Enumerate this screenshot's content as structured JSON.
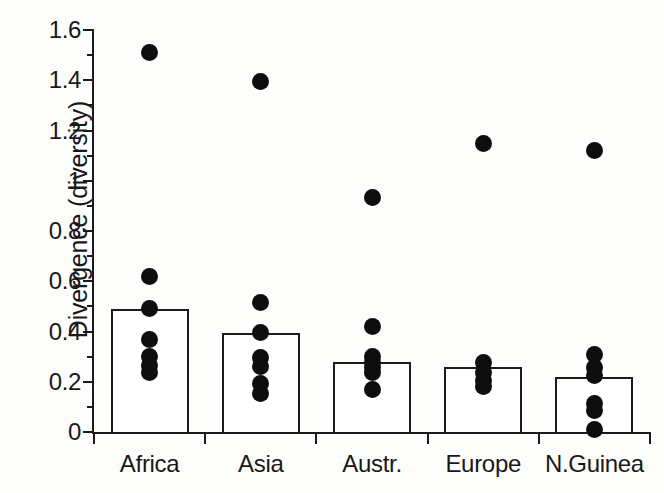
{
  "chart_data": {
    "type": "bar",
    "title": "",
    "xlabel": "",
    "ylabel": "Divergence (diversity)",
    "categories": [
      "Africa",
      "Asia",
      "Austr.",
      "Europe",
      "N.Guinea"
    ],
    "values": [
      0.49,
      0.395,
      0.28,
      0.26,
      0.22
    ],
    "ylim": [
      0,
      1.6
    ],
    "ytick_labels": [
      "0",
      "0.2",
      "0.4",
      "0.6",
      "0.8",
      "1",
      "1.2",
      "1.4",
      "1.6"
    ],
    "ytick_values": [
      0,
      0.2,
      0.4,
      0.6,
      0.8,
      1.0,
      1.2,
      1.4,
      1.6
    ],
    "yminor_values": [
      0.1,
      0.3,
      0.5,
      0.7,
      0.9,
      1.1,
      1.3,
      1.5
    ],
    "grid": false,
    "legend": "none",
    "overlay": {
      "type": "scatter",
      "marker": "filled-circle",
      "color": "#0e0e10",
      "points": [
        {
          "category": "Africa",
          "values": [
            1.51,
            0.62,
            0.49,
            0.37,
            0.3,
            0.265,
            0.235
          ]
        },
        {
          "category": "Asia",
          "values": [
            1.395,
            0.515,
            0.395,
            0.295,
            0.26,
            0.195,
            0.155
          ]
        },
        {
          "category": "Austr.",
          "values": [
            0.935,
            0.42,
            0.3,
            0.275,
            0.255,
            0.235,
            0.17
          ]
        },
        {
          "category": "Europe",
          "values": [
            1.15,
            0.275,
            0.235,
            0.205,
            0.18
          ]
        },
        {
          "category": "N.Guinea",
          "values": [
            1.12,
            0.31,
            0.255,
            0.225,
            0.115,
            0.085,
            0.01
          ]
        }
      ]
    }
  },
  "bleed": {
    "text": ""
  }
}
